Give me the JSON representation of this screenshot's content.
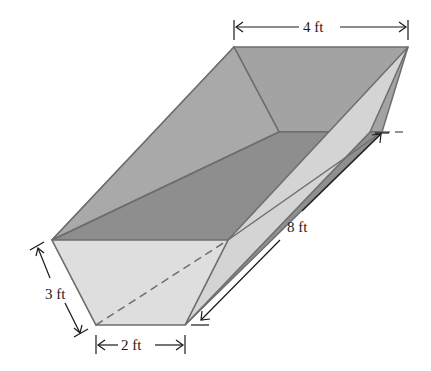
{
  "figure": {
    "type": "trapezoidal prism trough",
    "labels": {
      "top_width": "4 ft",
      "length": "8 ft",
      "height": "3 ft",
      "bottom_width": "2 ft"
    },
    "colors": {
      "top_face": "#a9a9a9",
      "back_slope": "#9e9e9e",
      "floor": "#8c8c8c",
      "front_face": "#dcdcdc",
      "right_side": "#d2d2d2",
      "edge": "#6e6e6e",
      "dimension_line": "#1a1a1a"
    }
  }
}
